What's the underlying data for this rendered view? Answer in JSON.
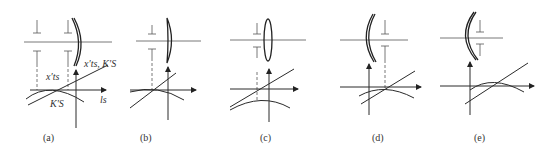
{
  "figure": {
    "panels": [
      {
        "id": "a",
        "caption": "(a)",
        "labels": {
          "line": "x′ts, K′S",
          "curve_top": "x′ts",
          "curve_bottom": "K′S",
          "axis": "ls"
        }
      },
      {
        "id": "b",
        "caption": "(b)"
      },
      {
        "id": "c",
        "caption": "(c)"
      },
      {
        "id": "d",
        "caption": "(d)"
      },
      {
        "id": "e",
        "caption": "(e)"
      }
    ],
    "colors": {
      "line": "#2a2a2a",
      "background": "#ffffff"
    }
  }
}
